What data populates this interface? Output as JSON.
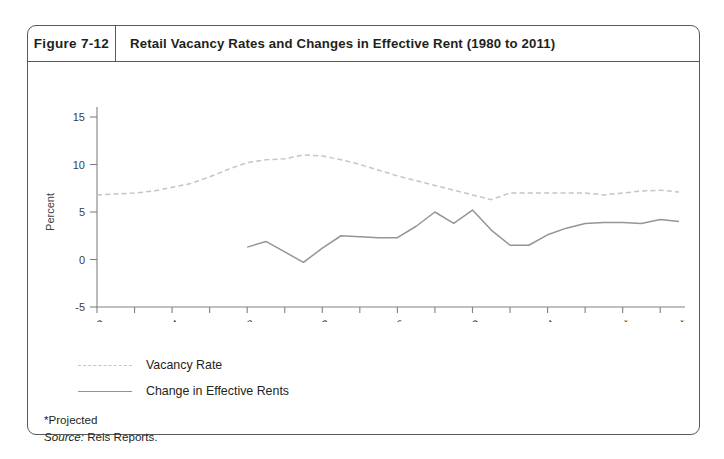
{
  "figure": {
    "number": "Figure 7-12",
    "title": "Retail Vacancy Rates and Changes in Effective Rent (1980 to 2011)"
  },
  "legend": {
    "items": [
      {
        "label": "Vacancy Rate",
        "style": "dashed",
        "color": "#c4c5c7"
      },
      {
        "label": "Change in Effective Rents",
        "style": "solid",
        "color": "#939597"
      }
    ]
  },
  "footnotes": {
    "projected": "*Projected",
    "source_label": "Source:",
    "source_value": "Reis Reports."
  },
  "chart_data": {
    "type": "line",
    "title": "Retail Vacancy Rates and Changes in Effective Rent (1980 to 2011)",
    "xlabel": "",
    "ylabel": "Percent",
    "ylim": [
      -5,
      15
    ],
    "yticks": [
      -5,
      0,
      5,
      10,
      15
    ],
    "ytick_labels": [
      "-5",
      "0",
      "5",
      "10",
      "15"
    ],
    "xlim": [
      1980,
      2011
    ],
    "xticks": [
      1980,
      1982,
      1984,
      1986,
      1988,
      1990,
      1992,
      1994,
      1996,
      1998,
      2000,
      2002,
      2004,
      2006,
      2008,
      2010
    ],
    "xtick_labels": [
      {
        "year": 1980,
        "text": "1980"
      },
      {
        "year": 1984,
        "text": "1984"
      },
      {
        "year": 1988,
        "text": "1988"
      },
      {
        "year": 1992,
        "text": "1992"
      },
      {
        "year": 1996,
        "text": "1996"
      },
      {
        "year": 2000,
        "text": "2000"
      },
      {
        "year": 2004,
        "text": "2004"
      },
      {
        "year": 2008,
        "text": "2008*"
      },
      {
        "year": 2011,
        "text": "2011*"
      }
    ],
    "grid": false,
    "legend_position": "below-left",
    "series": [
      {
        "name": "Vacancy Rate",
        "style": "dashed",
        "color": "#c4c5c7",
        "x": [
          1980,
          1981,
          1982,
          1983,
          1984,
          1985,
          1986,
          1987,
          1988,
          1989,
          1990,
          1991,
          1992,
          1993,
          1994,
          1995,
          1996,
          1997,
          1998,
          1999,
          2000,
          2001,
          2002,
          2003,
          2004,
          2005,
          2006,
          2007,
          2008,
          2009,
          2010,
          2011
        ],
        "values": [
          6.8,
          6.9,
          7.0,
          7.2,
          7.6,
          8.0,
          8.7,
          9.5,
          10.2,
          10.5,
          10.6,
          11.0,
          10.9,
          10.5,
          10.0,
          9.4,
          8.8,
          8.3,
          7.8,
          7.3,
          6.8,
          6.3,
          7.0,
          7.0,
          7.0,
          7.0,
          7.0,
          6.8,
          7.0,
          7.2,
          7.3,
          7.1
        ]
      },
      {
        "name": "Change in Effective Rents",
        "style": "solid",
        "color": "#939597",
        "x": [
          1988,
          1989,
          1990,
          1991,
          1992,
          1993,
          1994,
          1995,
          1996,
          1997,
          1998,
          1999,
          2000,
          2001,
          2002,
          2003,
          2004,
          2005,
          2006,
          2007,
          2008,
          2009,
          2010,
          2011
        ],
        "values": [
          1.3,
          1.9,
          0.8,
          -0.3,
          1.2,
          2.5,
          2.4,
          2.3,
          2.3,
          3.5,
          5.0,
          3.8,
          5.2,
          3.1,
          1.5,
          1.5,
          2.6,
          3.3,
          3.8,
          3.9,
          3.9,
          3.8,
          4.2,
          4.0
        ]
      }
    ]
  }
}
